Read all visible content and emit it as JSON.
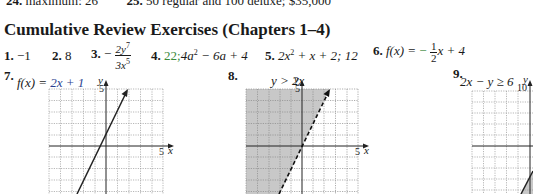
{
  "top_line": {
    "item24": {
      "num": "24.",
      "text": "maximum: 26"
    },
    "item25": {
      "num": "25.",
      "text": "50 regular and 100 deluxe; $35,000"
    }
  },
  "heading": "Cumulative Review Exercises (Chapters 1–4)",
  "answers": [
    {
      "num": "1.",
      "text": "−1"
    },
    {
      "num": "2.",
      "text": "8"
    },
    {
      "num": "3.",
      "sign": "−",
      "numerator": "2y",
      "numerator_exp": "7",
      "denominator": "3x",
      "denominator_exp": "5"
    },
    {
      "num": "4.",
      "part1": "22;",
      "part2": "4a",
      "exp": "2",
      "part3": " − 6a + 4"
    },
    {
      "num": "5.",
      "part1": "2x",
      "exp": "2",
      "part2": " + x + 2; 12"
    },
    {
      "num": "6.",
      "lhs": "f(x) = ",
      "sign": "−",
      "numerator": "1",
      "denominator": "2",
      "rest": "x + 4"
    }
  ],
  "graphs": [
    {
      "num": "7.",
      "label_lhs": "f(x) = ",
      "label_rhs": "2x + 1",
      "y_label": "y",
      "y_tick": "5",
      "x_tick": "5",
      "x_label": "x",
      "line_style": "solid",
      "shaded": false
    },
    {
      "num": "8.",
      "label": "y > 2x",
      "y_label": "y",
      "y_tick": "5",
      "x_tick": "5",
      "x_label": "x",
      "line_style": "dashed",
      "shaded": true
    },
    {
      "num": "9.",
      "label": "2x − y ≥ 6",
      "y_label": "y",
      "y_tick": "10",
      "line_style": "solid",
      "shaded": true
    }
  ],
  "colors": {
    "text": "#1a1a1a",
    "shade": "#c8c8c8",
    "grid": "#9a9a9a",
    "accent_green": "#3a8a3a",
    "accent_blue": "#2a3f8f"
  }
}
